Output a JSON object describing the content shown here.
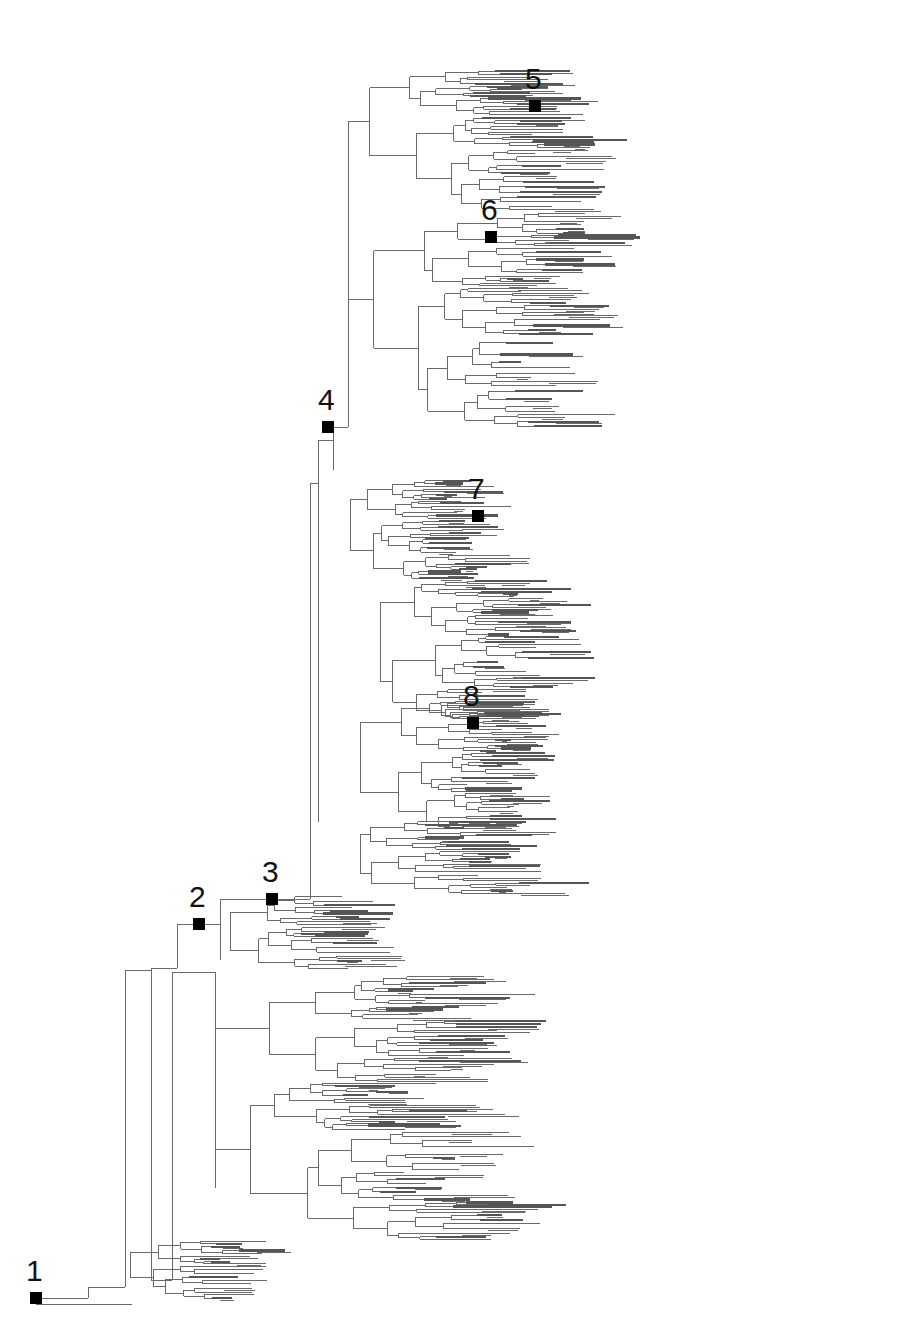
{
  "figure": {
    "type": "phylogenetic-tree",
    "layout": "rectangular",
    "orientation": "root-left",
    "branch_color": "#6a6a6a",
    "marker_color": "#000000",
    "background": "#ffffff"
  },
  "nodes": [
    {
      "label": "1",
      "x": 36,
      "y": 1298
    },
    {
      "label": "2",
      "x": 199,
      "y": 924
    },
    {
      "label": "3",
      "x": 272,
      "y": 899
    },
    {
      "label": "4",
      "x": 328,
      "y": 427
    },
    {
      "label": "5",
      "x": 535,
      "y": 106
    },
    {
      "label": "6",
      "x": 491,
      "y": 237
    },
    {
      "label": "7",
      "x": 478,
      "y": 516
    },
    {
      "label": "8",
      "x": 473,
      "y": 723
    }
  ],
  "trunk": [
    {
      "x1": 36,
      "y1": 1298,
      "x2": 88,
      "y2": 1298
    },
    {
      "x1": 88,
      "y1": 1287,
      "x2": 88,
      "y2": 1298
    },
    {
      "x1": 36,
      "y1": 1304,
      "x2": 132,
      "y2": 1304
    },
    {
      "x1": 88,
      "y1": 1287,
      "x2": 125,
      "y2": 1287
    },
    {
      "x1": 125,
      "y1": 970,
      "x2": 125,
      "y2": 1287
    },
    {
      "x1": 125,
      "y1": 970,
      "x2": 151,
      "y2": 970
    },
    {
      "x1": 151,
      "y1": 968,
      "x2": 151,
      "y2": 1280
    },
    {
      "x1": 151,
      "y1": 968,
      "x2": 177,
      "y2": 968
    },
    {
      "x1": 177,
      "y1": 924,
      "x2": 177,
      "y2": 968
    },
    {
      "x1": 177,
      "y1": 924,
      "x2": 220,
      "y2": 924
    },
    {
      "x1": 220,
      "y1": 899,
      "x2": 220,
      "y2": 960
    },
    {
      "x1": 220,
      "y1": 899,
      "x2": 310,
      "y2": 899
    },
    {
      "x1": 310,
      "y1": 483,
      "x2": 310,
      "y2": 899
    },
    {
      "x1": 310,
      "y1": 483,
      "x2": 318,
      "y2": 483
    },
    {
      "x1": 318,
      "y1": 440,
      "x2": 318,
      "y2": 822
    },
    {
      "x1": 318,
      "y1": 440,
      "x2": 333,
      "y2": 440
    },
    {
      "x1": 333,
      "y1": 427,
      "x2": 333,
      "y2": 470
    },
    {
      "x1": 333,
      "y1": 427,
      "x2": 348,
      "y2": 427
    },
    {
      "x1": 348,
      "y1": 290,
      "x2": 348,
      "y2": 427
    },
    {
      "x1": 151,
      "y1": 1280,
      "x2": 172,
      "y2": 1280
    },
    {
      "x1": 172,
      "y1": 972,
      "x2": 172,
      "y2": 1280
    },
    {
      "x1": 172,
      "y1": 972,
      "x2": 215,
      "y2": 972
    },
    {
      "x1": 215,
      "y1": 972,
      "x2": 215,
      "y2": 1188
    }
  ],
  "clades": [
    {
      "id": "top",
      "x": 348,
      "y0": 70,
      "y1": 428,
      "depth": 7,
      "spread": 470,
      "seed": 11
    },
    {
      "id": "mid-upper",
      "x": 350,
      "y0": 480,
      "y1": 580,
      "depth": 6,
      "spread": 260,
      "seed": 23
    },
    {
      "id": "mid-center",
      "x": 380,
      "y0": 580,
      "y1": 720,
      "depth": 6,
      "spread": 370,
      "seed": 37
    },
    {
      "id": "mid-lower",
      "x": 360,
      "y0": 700,
      "y1": 830,
      "depth": 6,
      "spread": 300,
      "seed": 41
    },
    {
      "id": "mid-bottom",
      "x": 360,
      "y0": 820,
      "y1": 895,
      "depth": 6,
      "spread": 400,
      "seed": 53
    },
    {
      "id": "clade-3",
      "x": 230,
      "y0": 895,
      "y1": 970,
      "depth": 5,
      "spread": 320,
      "seed": 61
    },
    {
      "id": "bottom",
      "x": 215,
      "y0": 975,
      "y1": 1240,
      "depth": 7,
      "spread": 560,
      "seed": 71
    },
    {
      "id": "basal",
      "x": 130,
      "y0": 1240,
      "y1": 1300,
      "depth": 5,
      "spread": 230,
      "seed": 83
    }
  ]
}
